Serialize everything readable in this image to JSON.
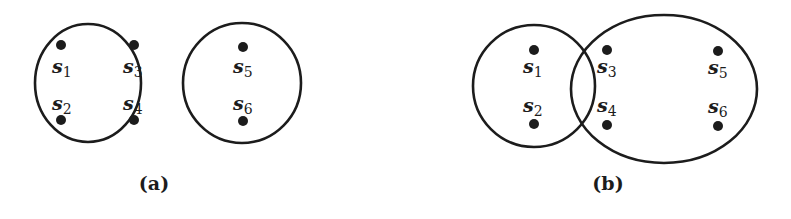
{
  "figure": {
    "panels": [
      {
        "id": "a",
        "caption": "(a)",
        "caption_pos": [
          154,
          190
        ],
        "sets": [
          {
            "shape": "circle",
            "cx": 88,
            "cy": 83,
            "rx": 53,
            "ry": 59
          },
          {
            "shape": "circle",
            "cx": 242,
            "cy": 83,
            "rx": 59,
            "ry": 60
          }
        ],
        "points": [
          {
            "name": "s",
            "sub": "1",
            "dot": [
              61,
              45
            ],
            "label": [
              52,
              73
            ]
          },
          {
            "name": "s",
            "sub": "3",
            "dot": [
              134,
              45
            ],
            "label": [
              123,
              73
            ]
          },
          {
            "name": "s",
            "sub": "2",
            "dot": [
              61,
              120
            ],
            "label": [
              52,
              110
            ]
          },
          {
            "name": "s",
            "sub": "4",
            "dot": [
              134,
              120
            ],
            "label": [
              123,
              110
            ]
          },
          {
            "name": "s",
            "sub": "5",
            "dot": [
              243,
              47
            ],
            "label": [
              233,
              73
            ]
          },
          {
            "name": "s",
            "sub": "6",
            "dot": [
              243,
              121
            ],
            "label": [
              233,
              110
            ]
          }
        ]
      },
      {
        "id": "b",
        "caption": "(b)",
        "caption_pos": [
          608,
          190
        ],
        "sets": [
          {
            "shape": "circle",
            "cx": 534,
            "cy": 86,
            "rx": 61,
            "ry": 61
          },
          {
            "shape": "ellipse",
            "cx": 664,
            "cy": 89,
            "rx": 93,
            "ry": 74
          }
        ],
        "points": [
          {
            "name": "s",
            "sub": "1",
            "dot": [
              534,
              50
            ],
            "label": [
              523,
              73
            ]
          },
          {
            "name": "s",
            "sub": "2",
            "dot": [
              534,
              124
            ],
            "label": [
              523,
              112
            ]
          },
          {
            "name": "s",
            "sub": "3",
            "dot": [
              607,
              50
            ],
            "label": [
              597,
              73
            ]
          },
          {
            "name": "s",
            "sub": "4",
            "dot": [
              607,
              125
            ],
            "label": [
              597,
              112
            ]
          },
          {
            "name": "s",
            "sub": "5",
            "dot": [
              718,
              51
            ],
            "label": [
              708,
              74
            ]
          },
          {
            "name": "s",
            "sub": "6",
            "dot": [
              718,
              126
            ],
            "label": [
              708,
              113
            ]
          }
        ]
      }
    ],
    "colors": {
      "ink": "#1c1c1c",
      "background": "#ffffff"
    }
  }
}
